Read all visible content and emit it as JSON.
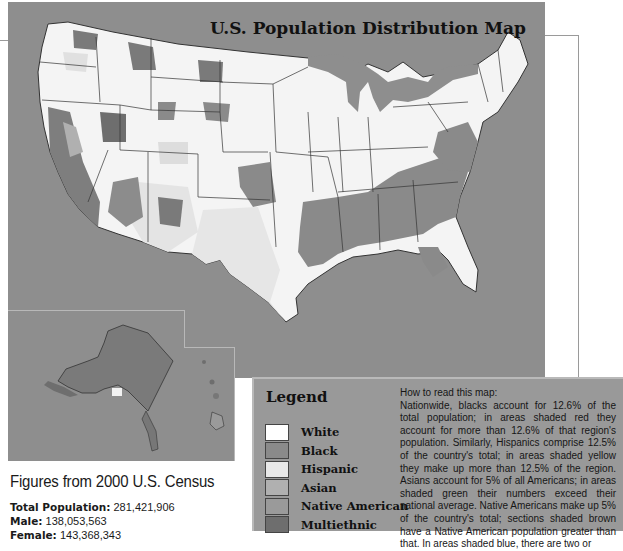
{
  "map": {
    "title": "U.S. Population Distribution Map",
    "colors": {
      "background": "#8e8e8e",
      "white": "#ffffff",
      "black": "#8a8a8a",
      "hispanic": "#e6e6e6",
      "asian": "#b0b0b0",
      "native_american": "#9a9a9a",
      "multiethnic": "#6e6e6e",
      "border": "#333333"
    }
  },
  "census": {
    "title": "Figures from 2000 U.S. Census",
    "rows": [
      {
        "label": "Total Population:",
        "value": "281,421,906"
      },
      {
        "label": "Male:",
        "value": "138,053,563"
      },
      {
        "label": "Female:",
        "value": "143,368,343"
      }
    ]
  },
  "legend": {
    "title": "Legend",
    "items": [
      {
        "label": "White",
        "color": "#ffffff"
      },
      {
        "label": "Black",
        "color": "#8a8a8a"
      },
      {
        "label": "Hispanic",
        "color": "#e8e8e8"
      },
      {
        "label": "Asian",
        "color": "#b0b0b0"
      },
      {
        "label": "Native American",
        "color": "#9a9a9a"
      },
      {
        "label": "Multiethnic",
        "color": "#6e6e6e"
      }
    ]
  },
  "how_to_read": {
    "heading": "How to read this map:",
    "body": "Nationwide, blacks account for 12.6% of the total population; in areas shaded red they account for more than 12.6% of that region's population. Similarly, Hispanics comprise 12.5% of the country's total; in areas shaded yellow they make up more than 12.5% of the region. Asians account for 5% of all Americans; in areas shaded green their numbers exceed their national average. Native Americans make up 5% of the country's total; sections shaded brown have a Native American population greater than that. In areas shaded blue, there are two or"
  }
}
